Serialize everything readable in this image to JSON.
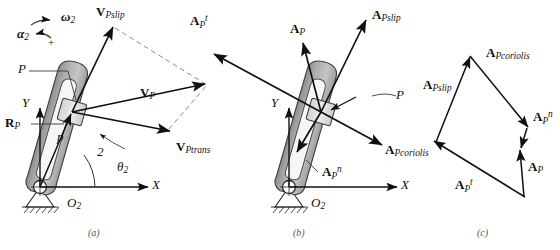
{
  "figure": {
    "panels": [
      {
        "id": "a",
        "caption": "(a)",
        "subject": "velocity analysis"
      },
      {
        "id": "b",
        "caption": "(b)",
        "subject": "acceleration analysis"
      },
      {
        "id": "c",
        "caption": "(c)",
        "subject": "acceleration vector polygon"
      }
    ]
  },
  "panel_a": {
    "caption": "(a)",
    "omega_label": "ω",
    "omega_sub": "2",
    "alpha_label": "α",
    "alpha_sub": "2",
    "plus_sign": "+",
    "point_label": "P",
    "axis_x": "X",
    "axis_y": "Y",
    "origin_label": "O",
    "origin_sub": "2",
    "link_number": "2",
    "theta_label": "θ",
    "theta_sub": "2",
    "radius_p": "p",
    "r_vector": "R",
    "r_vector_sub": "P",
    "v_slip": "V",
    "v_slip_sub": "P",
    "v_slip_sub2": "slip",
    "v_p": "V",
    "v_p_sub": "P",
    "v_trans": "V",
    "v_trans_sub": "P",
    "v_trans_sub2": "trans"
  },
  "panel_b": {
    "caption": "(b)",
    "point_label": "P",
    "axis_x": "X",
    "axis_y": "Y",
    "origin_label": "O",
    "origin_sub": "2",
    "a_tangential": "A",
    "a_tangential_sub": "P",
    "a_tangential_sup": "t",
    "a_p": "A",
    "a_p_sub": "P",
    "a_slip": "A",
    "a_slip_sub": "P",
    "a_slip_sub2": "slip",
    "a_coriolis": "A",
    "a_coriolis_sub": "P",
    "a_coriolis_sub2": "coriolis",
    "a_normal": "A",
    "a_normal_sub": "P",
    "a_normal_sup": "n"
  },
  "panel_c": {
    "caption": "(c)",
    "a_slip": "A",
    "a_slip_sub": "P",
    "a_slip_sub2": "slip",
    "a_coriolis": "A",
    "a_coriolis_sub": "P",
    "a_coriolis_sub2": "coriolis",
    "a_normal": "A",
    "a_normal_sub": "P",
    "a_normal_sup": "n",
    "a_p": "A",
    "a_p_sub": "P",
    "a_tangential": "A",
    "a_tangential_sub": "P",
    "a_tangential_sup": "t"
  },
  "colors": {
    "ink": "#101010",
    "link_fill": "#b9b9b9",
    "link_fill_light": "#d8d8d8",
    "link_edge": "#4a4a4a",
    "slider_fill": "#e3e3e3",
    "ground": "#ffffff",
    "dashed": "#7a7a7a",
    "caption": "#555555"
  }
}
